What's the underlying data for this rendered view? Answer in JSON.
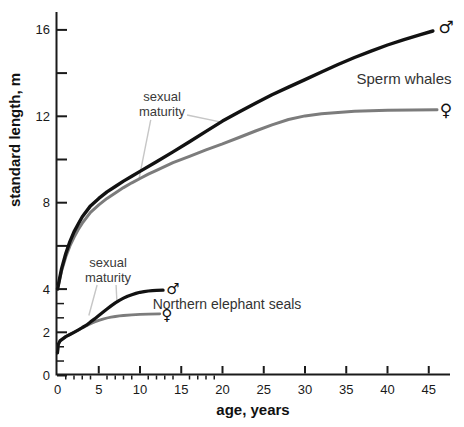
{
  "figure": {
    "width": 464,
    "height": 427,
    "colors": {
      "male_curve": "#121212",
      "female_curve": "#7c7c7c",
      "axis": "#1a1a1a",
      "leader": "#c6c6c6",
      "text": "#2a2a2a"
    }
  },
  "chart_data": {
    "type": "line",
    "title": "",
    "xlabel": "age, years",
    "ylabel": "standard length, m",
    "xlim": [
      0,
      47.5
    ],
    "ylim": [
      0,
      16.8
    ],
    "grid": false,
    "x_major_ticks": [
      0,
      5,
      10,
      15,
      20,
      25,
      30,
      35,
      40,
      45
    ],
    "x_minor_ticks": [
      1,
      2,
      3,
      4,
      6,
      7,
      8,
      9,
      11,
      12,
      13,
      14,
      16,
      17,
      18,
      19
    ],
    "y_labeled_ticks": [
      16,
      12,
      8,
      4,
      2,
      0
    ],
    "y_unlabeled_ticks": [
      14,
      10,
      6
    ],
    "y_small_ticks": [
      3.33,
      2.67,
      1.33,
      0.67
    ],
    "series": [
      {
        "name": "sperm-whale-female",
        "sex": "female",
        "color_key": "female_curve",
        "stroke_width": 3,
        "points": [
          [
            0,
            4.0
          ],
          [
            0.5,
            4.85
          ],
          [
            1,
            5.5
          ],
          [
            1.5,
            6.0
          ],
          [
            2,
            6.4
          ],
          [
            2.5,
            6.75
          ],
          [
            3,
            7.05
          ],
          [
            4,
            7.55
          ],
          [
            5,
            7.9
          ],
          [
            6,
            8.2
          ],
          [
            7,
            8.45
          ],
          [
            8,
            8.7
          ],
          [
            9,
            8.92
          ],
          [
            10,
            9.12
          ],
          [
            11,
            9.32
          ],
          [
            12,
            9.5
          ],
          [
            14,
            9.85
          ],
          [
            16,
            10.15
          ],
          [
            18,
            10.45
          ],
          [
            20,
            10.72
          ],
          [
            22,
            11.02
          ],
          [
            24,
            11.32
          ],
          [
            26,
            11.6
          ],
          [
            28,
            11.85
          ],
          [
            30,
            12.02
          ],
          [
            32,
            12.12
          ],
          [
            34,
            12.18
          ],
          [
            36,
            12.23
          ],
          [
            38,
            12.26
          ],
          [
            40,
            12.28
          ],
          [
            43,
            12.29
          ],
          [
            46,
            12.3
          ]
        ]
      },
      {
        "name": "sperm-whale-male",
        "sex": "male",
        "color_key": "male_curve",
        "stroke_width": 3.4,
        "points": [
          [
            0,
            4.0
          ],
          [
            0.5,
            4.95
          ],
          [
            1,
            5.65
          ],
          [
            1.5,
            6.2
          ],
          [
            2,
            6.65
          ],
          [
            2.5,
            7.0
          ],
          [
            3,
            7.35
          ],
          [
            4,
            7.85
          ],
          [
            5,
            8.2
          ],
          [
            6,
            8.5
          ],
          [
            7,
            8.75
          ],
          [
            8,
            9.0
          ],
          [
            9,
            9.22
          ],
          [
            10,
            9.45
          ],
          [
            12,
            9.9
          ],
          [
            14,
            10.35
          ],
          [
            16,
            10.82
          ],
          [
            18,
            11.3
          ],
          [
            20,
            11.78
          ],
          [
            22,
            12.2
          ],
          [
            24,
            12.6
          ],
          [
            26,
            13.0
          ],
          [
            28,
            13.35
          ],
          [
            30,
            13.7
          ],
          [
            32,
            14.05
          ],
          [
            34,
            14.4
          ],
          [
            36,
            14.72
          ],
          [
            38,
            15.02
          ],
          [
            40,
            15.3
          ],
          [
            42,
            15.55
          ],
          [
            44,
            15.78
          ],
          [
            45.5,
            15.95
          ]
        ]
      },
      {
        "name": "elephant-seal-female",
        "sex": "female",
        "color_key": "female_curve",
        "stroke_width": 2.8,
        "points": [
          [
            0,
            1.05
          ],
          [
            0.1,
            1.45
          ],
          [
            0.3,
            1.6
          ],
          [
            1,
            1.8
          ],
          [
            1.5,
            1.9
          ],
          [
            2,
            2.0
          ],
          [
            2.5,
            2.1
          ],
          [
            3,
            2.2
          ],
          [
            3.5,
            2.3
          ],
          [
            4,
            2.4
          ],
          [
            4.5,
            2.48
          ],
          [
            5,
            2.55
          ],
          [
            5.5,
            2.61
          ],
          [
            6,
            2.66
          ],
          [
            6.5,
            2.7
          ],
          [
            7,
            2.73
          ],
          [
            7.5,
            2.76
          ],
          [
            8,
            2.78
          ],
          [
            9,
            2.81
          ],
          [
            10,
            2.83
          ],
          [
            11,
            2.84
          ],
          [
            12.4,
            2.85
          ]
        ]
      },
      {
        "name": "elephant-seal-male",
        "sex": "male",
        "color_key": "male_curve",
        "stroke_width": 3.2,
        "points": [
          [
            0,
            1.05
          ],
          [
            0.1,
            1.45
          ],
          [
            0.3,
            1.6
          ],
          [
            1,
            1.8
          ],
          [
            1.5,
            1.9
          ],
          [
            2,
            2.0
          ],
          [
            2.5,
            2.1
          ],
          [
            3,
            2.22
          ],
          [
            3.5,
            2.33
          ],
          [
            4,
            2.48
          ],
          [
            4.5,
            2.62
          ],
          [
            5,
            2.78
          ],
          [
            5.5,
            2.93
          ],
          [
            6,
            3.08
          ],
          [
            6.5,
            3.22
          ],
          [
            7,
            3.36
          ],
          [
            7.5,
            3.48
          ],
          [
            8,
            3.58
          ],
          [
            8.5,
            3.67
          ],
          [
            9,
            3.74
          ],
          [
            9.5,
            3.8
          ],
          [
            10,
            3.85
          ],
          [
            10.5,
            3.88
          ],
          [
            11,
            3.91
          ],
          [
            11.5,
            3.93
          ],
          [
            12,
            3.94
          ],
          [
            12.8,
            3.95
          ]
        ]
      }
    ],
    "leader_lines": [
      {
        "note": "whale-female-maturity",
        "from": [
          11.3,
          11.83
        ],
        "to": [
          9.85,
          9.05
        ]
      },
      {
        "note": "whale-male-maturity",
        "from": [
          15.7,
          12.06
        ],
        "to": [
          19.7,
          11.74
        ]
      },
      {
        "note": "seal-female-maturity",
        "from": [
          4.8,
          4.19
        ],
        "to": [
          3.8,
          2.78
        ]
      },
      {
        "note": "seal-male-maturity",
        "from": [
          7.1,
          4.19
        ],
        "to": [
          7.2,
          3.42
        ]
      }
    ],
    "annotations": {
      "sperm_whales": "Sperm whales",
      "elephant_seals": "Northern elephant seals",
      "sexual_maturity": "sexual\nmaturity",
      "male_symbol": "♂",
      "female_symbol": "♀"
    }
  }
}
